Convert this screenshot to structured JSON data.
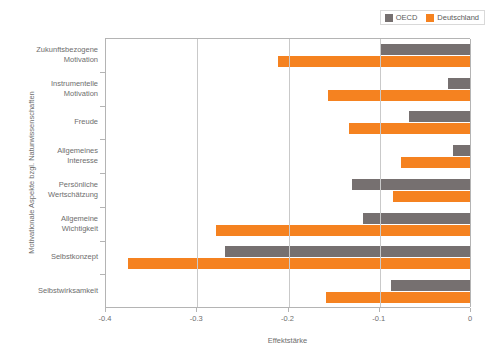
{
  "chart_data": {
    "type": "bar",
    "orientation": "horizontal",
    "title": "",
    "xlabel": "Effektstärke",
    "ylabel": "Motivationale Aspekte bzgl. Naturwissenschaften",
    "xlim": [
      -0.4,
      0
    ],
    "xticks": [
      -0.4,
      -0.3,
      -0.2,
      -0.1,
      0
    ],
    "xtick_labels": [
      "-0.4",
      "-0.3",
      "-0.2",
      "-0.1",
      "0"
    ],
    "grid": true,
    "legend_position": "top-right",
    "categories": [
      "Zukunftsbezogene Motivation",
      "Instrumentelle Motivation",
      "Freude",
      "Allgemeines Interesse",
      "Persönliche Wertschätzung",
      "Allgemeine Wichtigkeit",
      "Selbstkonzept",
      "Selbstwirksamkeit"
    ],
    "category_lines": [
      [
        "Zukunftsbezogene",
        "Motivation"
      ],
      [
        "Instrumentelle",
        "Motivation"
      ],
      [
        "Freude"
      ],
      [
        "Allgemeines",
        "Interesse"
      ],
      [
        "Persönliche",
        "Wertschätzung"
      ],
      [
        "Allgemeine",
        "Wichtigkeit"
      ],
      [
        "Selbstkonzept"
      ],
      [
        "Selbstwirksamkeit"
      ]
    ],
    "series": [
      {
        "name": "OECD",
        "color": "#767070",
        "values": [
          -0.1,
          -0.025,
          -0.068,
          -0.02,
          -0.13,
          -0.118,
          -0.27,
          -0.088
        ]
      },
      {
        "name": "Deutschland",
        "color": "#f58220",
        "values": [
          -0.212,
          -0.157,
          -0.134,
          -0.077,
          -0.086,
          -0.279,
          -0.376,
          -0.159
        ]
      }
    ]
  },
  "legend": {
    "items": [
      {
        "label": "OECD",
        "color": "#767070"
      },
      {
        "label": "Deutschland",
        "color": "#f58220"
      }
    ]
  },
  "axes": {
    "x_title": "Effektstärke",
    "y_title": "Motivationale Aspekte bzgl. Naturwissenschaften"
  },
  "colors": {
    "oecd": "#767070",
    "deutschland": "#f58220",
    "axis": "#b4b4b4",
    "grid": "#c9c9c9",
    "text": "#6e6e6e",
    "background": "#ffffff"
  }
}
